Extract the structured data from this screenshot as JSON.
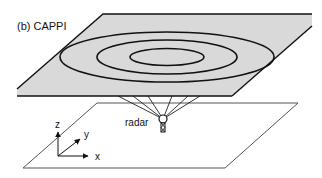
{
  "diagram": {
    "panel_label": "(b) CAPPI",
    "radar_label": "radar",
    "axes": {
      "z_label": "z",
      "y_label": "y",
      "x_label": "x"
    },
    "top_plane": {
      "description": "Constant altitude horizontal plane (CAPPI surface) with concentric contour ellipses",
      "fill": "#d9d9d9",
      "stroke": "#111111",
      "contour_count": 3
    },
    "ground_plane": {
      "description": "Ground-level reference plane",
      "fill": "#ffffff",
      "stroke": "#555555"
    },
    "radar": {
      "beam_count": 6,
      "stroke": "#222222"
    }
  }
}
